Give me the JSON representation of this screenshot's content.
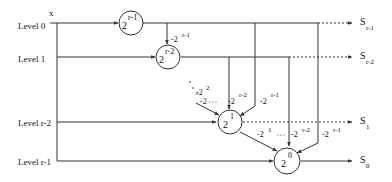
{
  "diagram": {
    "input_label": "x",
    "levels": [
      {
        "label": "Level 0"
      },
      {
        "label": "Level 1"
      },
      {
        "label": "Level r-2"
      },
      {
        "label": "Level r-1"
      }
    ],
    "nodes": [
      {
        "base": "2",
        "exp": "r-1"
      },
      {
        "base": "2",
        "exp": "r-2"
      },
      {
        "base": "2",
        "exp": "1"
      },
      {
        "base": "2",
        "exp": "0"
      }
    ],
    "weights": [
      {
        "base": "-2",
        "exp": "r-1"
      },
      {
        "base": "-2",
        "exp": "2"
      },
      {
        "base": "-2",
        "exp": ""
      },
      {
        "base": "-2",
        "exp": "r-2"
      },
      {
        "base": "-2",
        "exp": "r-1"
      },
      {
        "base": "-2",
        "exp": "1"
      },
      {
        "base": "-2",
        "exp": "r-2"
      },
      {
        "base": "-2",
        "exp": "r-1"
      }
    ],
    "outputs": [
      {
        "base": "S",
        "sub": "r-1"
      },
      {
        "base": "S",
        "sub": "r-2"
      },
      {
        "base": "S",
        "sub": "1"
      },
      {
        "base": "S",
        "sub": "0"
      }
    ],
    "colors": {
      "stroke": "#333333",
      "text": "#111111",
      "background": "#ffffff"
    }
  }
}
